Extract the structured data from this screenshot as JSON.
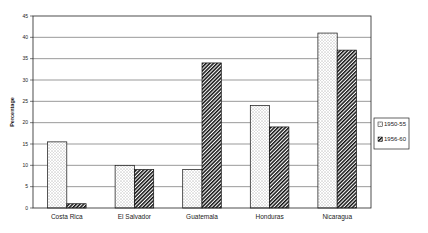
{
  "chart_data": {
    "type": "bar",
    "title": "",
    "xlabel": "",
    "ylabel": "Percentage",
    "ylim": [
      0,
      45
    ],
    "yticks": [
      0,
      5,
      10,
      15,
      20,
      25,
      30,
      35,
      40,
      45
    ],
    "grid": true,
    "legend_position": "right",
    "categories": [
      "Costa Rica",
      "El Salvador",
      "Guatemala",
      "Honduras",
      "Nicaragua"
    ],
    "series": [
      {
        "name": "1950-55",
        "pattern": "dotted",
        "values": [
          15.5,
          10,
          9,
          24,
          41
        ]
      },
      {
        "name": "1956-60",
        "pattern": "diagonal-hatch",
        "values": [
          1,
          9,
          34,
          19,
          37
        ]
      }
    ]
  },
  "colors": {
    "axis": "#222222",
    "grid": "#555555",
    "bar_outline": "#111111"
  }
}
